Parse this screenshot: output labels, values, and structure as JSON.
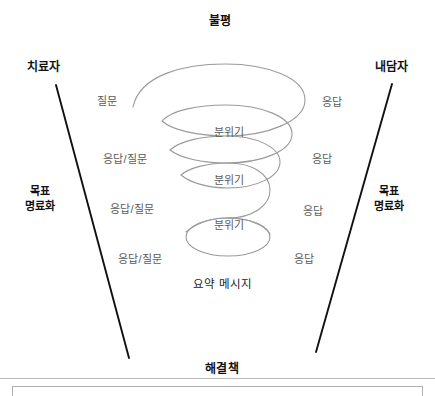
{
  "diagram": {
    "title_top": "불평",
    "title_bottom": "해결책",
    "left_actor": "치료자",
    "right_actor": "내담자",
    "left_goal": {
      "line1": "목표",
      "line2": "명료화"
    },
    "right_goal": {
      "line1": "목표",
      "line2": "명료화"
    },
    "summary_message": "요약 메시지",
    "left_messages": [
      {
        "text": "질문",
        "x": 97,
        "y": 95
      },
      {
        "text": "응답/질문",
        "x": 103,
        "y": 153
      },
      {
        "text": "응답/질문",
        "x": 110,
        "y": 203
      },
      {
        "text": "응답/질문",
        "x": 118,
        "y": 253
      }
    ],
    "right_messages": [
      {
        "text": "응답",
        "x": 322,
        "y": 96
      },
      {
        "text": "응답",
        "x": 312,
        "y": 153
      },
      {
        "text": "응답",
        "x": 303,
        "y": 205
      },
      {
        "text": "응답",
        "x": 294,
        "y": 253
      }
    ],
    "mood_labels": [
      {
        "text": "분위기",
        "x": 229,
        "y": 126
      },
      {
        "text": "분위기",
        "x": 229,
        "y": 174
      },
      {
        "text": "분위기",
        "x": 229,
        "y": 219
      }
    ],
    "colors": {
      "spiral_stroke": "#9a9a9a",
      "funnel_stroke": "#111111",
      "label_text": "#5b5b5b",
      "heading_text": "#111111",
      "rule": "#b9b9b9"
    },
    "funnel": {
      "left_line": {
        "x1": 56,
        "y1": 85,
        "x2": 129,
        "y2": 358
      },
      "right_line": {
        "x1": 392,
        "y1": 84,
        "x2": 316,
        "y2": 352
      }
    }
  }
}
